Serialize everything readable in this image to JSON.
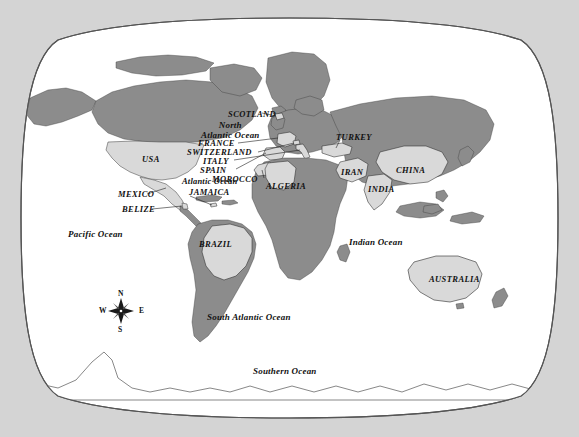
{
  "map": {
    "title": "World Map",
    "projection": "winkel-tripel",
    "background_color": "#d4d4d4",
    "ocean_color": "#ffffff",
    "land_color": "#8c8c8c",
    "highlight_color": "#d9d9d9",
    "border_color": "#555555",
    "label_color": "#111111"
  },
  "country_labels": [
    {
      "name": "SCOTLAND",
      "x": 228,
      "y": 114
    },
    {
      "name": "FRANCE",
      "x": 210,
      "y": 143
    },
    {
      "name": "SWITZERLAND",
      "x": 200,
      "y": 152
    },
    {
      "name": "ITALY",
      "x": 216,
      "y": 161
    },
    {
      "name": "SPAIN",
      "x": 215,
      "y": 170
    },
    {
      "name": "MOROCCO",
      "x": 229,
      "y": 179
    },
    {
      "name": "ALGERIA",
      "x": 268,
      "y": 186
    },
    {
      "name": "TURKEY",
      "x": 337,
      "y": 137
    },
    {
      "name": "IRAN",
      "x": 341,
      "y": 172
    },
    {
      "name": "INDIA",
      "x": 370,
      "y": 189
    },
    {
      "name": "CHINA",
      "x": 398,
      "y": 170
    },
    {
      "name": "USA",
      "x": 142,
      "y": 159
    },
    {
      "name": "MEXICO",
      "x": 122,
      "y": 194
    },
    {
      "name": "BELIZE",
      "x": 126,
      "y": 209
    },
    {
      "name": "JAMAICA",
      "x": 192,
      "y": 192
    },
    {
      "name": "BRAZIL",
      "x": 201,
      "y": 244
    },
    {
      "name": "AUSTRALIA",
      "x": 432,
      "y": 279
    }
  ],
  "ocean_labels": [
    {
      "name": "North Atlantic Ocean",
      "line1": "North",
      "line2": "Atlantic Ocean",
      "x": 213,
      "y": 124
    },
    {
      "name": "Atlantic Ocean",
      "line1": "Atlantic Ocean",
      "line2": "",
      "x": 185,
      "y": 181
    },
    {
      "name": "Pacific Ocean",
      "line1": "Pacific Ocean",
      "line2": "",
      "x": 70,
      "y": 234
    },
    {
      "name": "Indian Ocean",
      "line1": "Indian Ocean",
      "line2": "",
      "x": 351,
      "y": 242
    },
    {
      "name": "South Atlantic Ocean",
      "line1": "South Atlantic Ocean",
      "line2": "",
      "x": 209,
      "y": 317
    },
    {
      "name": "Southern Ocean",
      "line1": "Southern Ocean",
      "line2": "",
      "x": 256,
      "y": 371
    }
  ],
  "compass": {
    "name": "compass-rose",
    "x": 121,
    "y": 311,
    "north": "N",
    "east": "E",
    "south": "S",
    "west": "W"
  }
}
